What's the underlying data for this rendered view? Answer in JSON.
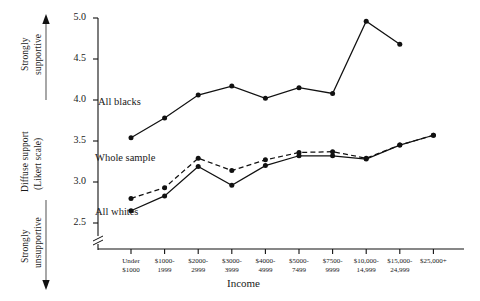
{
  "chart_data": {
    "type": "line",
    "title": "",
    "xlabel": "Income",
    "ylabel": "Diffuse support (Likert scale)",
    "ylim": [
      2.35,
      5.0
    ],
    "yticks": [
      2.5,
      3.0,
      3.5,
      4.0,
      4.5,
      5.0
    ],
    "ytick_labels": [
      "2.5",
      "3.0",
      "3.5",
      "4.0",
      "4.5",
      "5.0"
    ],
    "y_axis_break": true,
    "grid": false,
    "legend_position": "inline-annotations",
    "categories": [
      "Under $1000",
      "$1000-1999",
      "$2000-2999",
      "$3000-3999",
      "$4000-4999",
      "$5000-7499",
      "$7500-9999",
      "$10,000-14,999",
      "$15,000-24,999",
      "$25,000+"
    ],
    "category_lines": [
      [
        "Under",
        "$1000"
      ],
      [
        "$1000-",
        "1999"
      ],
      [
        "$2000-",
        "2999"
      ],
      [
        "$3000-",
        "3999"
      ],
      [
        "$4000-",
        "4999"
      ],
      [
        "$5000-",
        "7499"
      ],
      [
        "$7500-",
        "9999"
      ],
      [
        "$10,000-",
        "14,999"
      ],
      [
        "$15,000-",
        "24,999"
      ],
      [
        "$25,000+",
        ""
      ]
    ],
    "series": [
      {
        "name": "All blacks",
        "style": "solid",
        "values": [
          3.54,
          3.78,
          4.06,
          4.17,
          4.02,
          4.15,
          4.08,
          4.96,
          4.68,
          null
        ]
      },
      {
        "name": "Whole sample",
        "style": "dashed",
        "values": [
          2.8,
          2.93,
          3.29,
          3.14,
          3.27,
          3.36,
          3.37,
          3.29,
          3.45,
          3.57
        ]
      },
      {
        "name": "All whites",
        "style": "solid",
        "values": [
          2.65,
          2.83,
          3.19,
          2.96,
          3.2,
          3.32,
          3.32,
          3.28,
          3.45,
          3.57
        ]
      }
    ],
    "annotations": {
      "top_axis_note": "Strongly supportive",
      "bottom_axis_note": "Strongly unsupportive"
    }
  },
  "axis": {
    "y_title_line1": "Diffuse support",
    "y_title_line2": "(Likert scale)",
    "y_top_label_line1": "Strongly",
    "y_top_label_line2": "supportive",
    "y_bottom_label_line1": "Strongly",
    "y_bottom_label_line2": "unsupportive",
    "x_title": "Income"
  },
  "series_labels": {
    "all_blacks": "All blacks",
    "whole_sample": "Whole sample",
    "all_whites": "All whites"
  }
}
